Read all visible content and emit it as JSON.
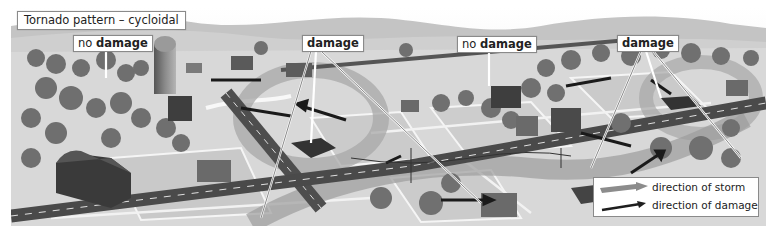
{
  "figure": {
    "title": "Tornado pattern – cycloidal",
    "labels": [
      {
        "id": "no-damage-1",
        "prefix": "no ",
        "text": "damage"
      },
      {
        "id": "damage-1",
        "prefix": "",
        "text": "damage"
      },
      {
        "id": "no-damage-2",
        "prefix": "no ",
        "text": "damage"
      },
      {
        "id": "damage-2",
        "prefix": "",
        "text": "damage"
      }
    ],
    "legend": {
      "items": [
        {
          "label": "direction of storm",
          "icon": "wide-gray-arrow-icon",
          "color": "#8c8c8c"
        },
        {
          "label": "direction of damage",
          "icon": "thin-black-arrow-icon",
          "color": "#1e1e1e"
        }
      ]
    },
    "colors": {
      "sky": "#f0f0f0",
      "hills": "#bdbdbd",
      "ground": "#d6d6d6",
      "road": "#4a4a4a",
      "trees": "#6e6e6e",
      "barn": "#3a3a3a",
      "storm_path": "#9a9a9a",
      "damage_arrow": "#1a1a1a"
    }
  }
}
